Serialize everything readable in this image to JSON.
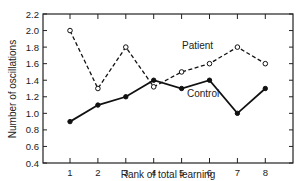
{
  "chart_data": {
    "type": "line",
    "title": "",
    "xlabel": "Rank of total learning",
    "ylabel": "Number of oscillations",
    "x": [
      1,
      2,
      3,
      4,
      5,
      6,
      7,
      8
    ],
    "xticks": [
      "1",
      "2",
      "3",
      "4",
      "5",
      "6",
      "7",
      "8"
    ],
    "yticks": [
      "0.4",
      "0.6",
      "0.8",
      "1.0",
      "1.2",
      "1.4",
      "1.6",
      "1.8",
      "2.0",
      "2.2"
    ],
    "ylim": [
      0.4,
      2.2
    ],
    "grid": false,
    "legend_position": "inline labels",
    "series": [
      {
        "name": "Patient",
        "style": "dashed, open circles",
        "values": [
          2.0,
          1.3,
          1.8,
          1.32,
          1.5,
          1.6,
          1.8,
          1.6
        ]
      },
      {
        "name": "Control",
        "style": "solid, filled circles",
        "values": [
          0.9,
          1.1,
          1.2,
          1.4,
          1.3,
          1.4,
          1.0,
          1.3
        ]
      }
    ]
  },
  "labels": {
    "patient": "Patient",
    "control": "Control",
    "xlabel": "Rank of total learning",
    "ylabel": "Number of oscillations"
  },
  "colors": {
    "line": "#111111",
    "axis": "#222222"
  }
}
